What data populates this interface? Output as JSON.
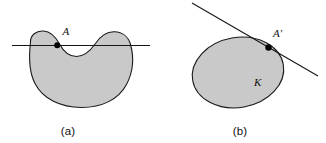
{
  "figure": {
    "background_color": "#ffffff",
    "region_fill_color": "#c9c9c9",
    "outline_color": "#1a1a1a",
    "line_color": "#151515",
    "point_color": "#000000",
    "panels": [
      {
        "id": "panel-a",
        "caption": "(a)",
        "shape_type": "non-convex bean region",
        "point_label": "A",
        "line_type": "secant line",
        "region_label": ""
      },
      {
        "id": "panel-b",
        "caption": "(b)",
        "shape_type": "convex ellipse region",
        "point_label": "A'",
        "line_type": "tangent line",
        "region_label": "K"
      }
    ]
  }
}
